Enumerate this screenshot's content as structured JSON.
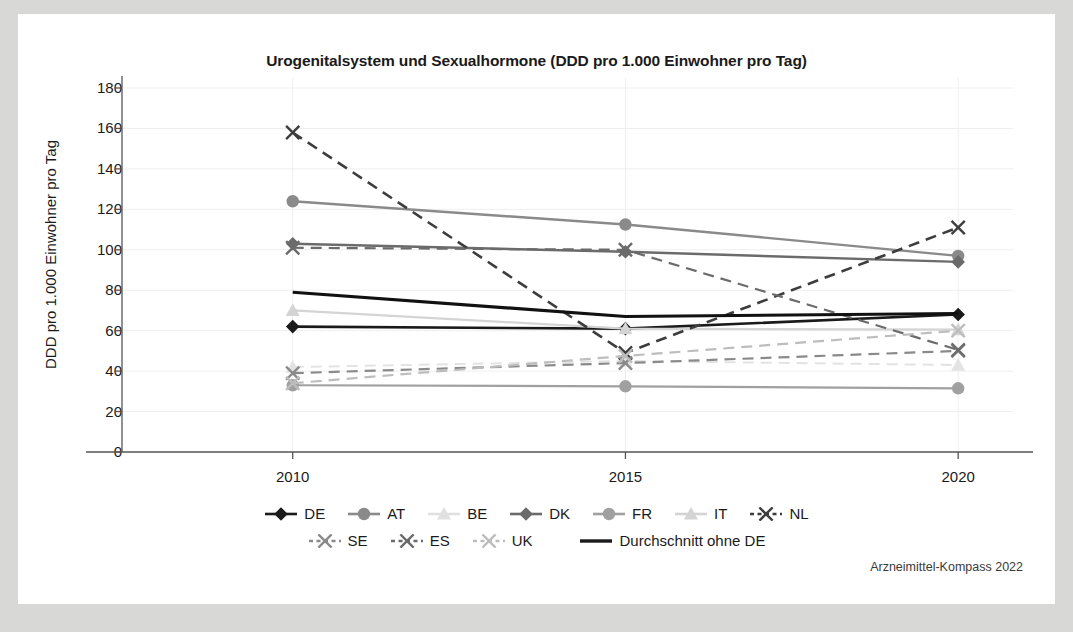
{
  "card": {
    "background": "#ffffff",
    "page_background": "#d8d8d6"
  },
  "source_note": "Arzneimittel-Kompass 2022",
  "axis": {
    "ylabel": "DDD pro 1.000 Einwohner pro Tag",
    "yticks": [
      180,
      160,
      140,
      120,
      100,
      80,
      60,
      40,
      20,
      0
    ],
    "xticks": [
      "2010",
      "2015",
      "2020"
    ]
  },
  "legend": {
    "rows": [
      [
        {
          "label": "DE",
          "marker": "diamond",
          "dash": "solid",
          "color": "#1a1a1a"
        },
        {
          "label": "AT",
          "marker": "circle",
          "dash": "solid",
          "color": "#8a8a8a"
        },
        {
          "label": "BE",
          "marker": "triangle",
          "dash": "solid",
          "color": "#e0e0e0"
        },
        {
          "label": "DK",
          "marker": "diamond",
          "dash": "solid",
          "color": "#6b6b6b"
        },
        {
          "label": "FR",
          "marker": "circle",
          "dash": "solid",
          "color": "#a0a0a0"
        },
        {
          "label": "IT",
          "marker": "triangle",
          "dash": "solid",
          "color": "#d4d4d4"
        },
        {
          "label": "NL",
          "marker": "cross",
          "dash": "dashed",
          "color": "#3d3d3d"
        }
      ],
      [
        {
          "label": "SE",
          "marker": "cross",
          "dash": "dashed",
          "color": "#8a8a8a"
        },
        {
          "label": "ES",
          "marker": "cross",
          "dash": "dashed",
          "color": "#6b6b6b"
        },
        {
          "label": "UK",
          "marker": "cross",
          "dash": "dashed",
          "color": "#bdbdbd"
        },
        {
          "label": "Durchschnitt ohne DE",
          "marker": "none",
          "dash": "solid",
          "color": "#1a1a1a"
        }
      ]
    ]
  },
  "chart_data": {
    "type": "line",
    "title": "Urogenitalsystem und Sexualhormone (DDD pro 1.000 Einwohner pro Tag)",
    "xlabel": "",
    "ylabel": "DDD pro 1.000 Einwohner pro Tag",
    "x": [
      "2010",
      "2015",
      "2020"
    ],
    "ylim": [
      0,
      180
    ],
    "ytick_step": 20,
    "grid": true,
    "legend_position": "bottom",
    "series": [
      {
        "name": "DE",
        "values": [
          62,
          61,
          68
        ],
        "marker": "diamond",
        "dash": "solid",
        "color": "#1a1a1a",
        "width": 2.6
      },
      {
        "name": "AT",
        "values": [
          124,
          112.5,
          97
        ],
        "marker": "circle",
        "dash": "solid",
        "color": "#8a8a8a",
        "width": 2.4
      },
      {
        "name": "BE",
        "values": [
          42,
          45,
          43
        ],
        "marker": "triangle",
        "dash": "dashed",
        "color": "#e3e3e3",
        "width": 2.0
      },
      {
        "name": "DK",
        "values": [
          103,
          99,
          94
        ],
        "marker": "diamond",
        "dash": "solid",
        "color": "#6b6b6b",
        "width": 2.4
      },
      {
        "name": "FR",
        "values": [
          33,
          32.5,
          31.5
        ],
        "marker": "circle",
        "dash": "solid",
        "color": "#a0a0a0",
        "width": 2.2
      },
      {
        "name": "IT",
        "values": [
          70,
          61,
          60.5
        ],
        "marker": "triangle",
        "dash": "solid",
        "color": "#d4d4d4",
        "width": 2.2
      },
      {
        "name": "NL",
        "values": [
          158,
          49,
          111
        ],
        "marker": "cross",
        "dash": "dashed",
        "color": "#3d3d3d",
        "width": 2.6
      },
      {
        "name": "SE",
        "values": [
          39,
          44,
          50
        ],
        "marker": "cross",
        "dash": "dashed",
        "color": "#8a8a8a",
        "width": 2.2
      },
      {
        "name": "ES",
        "values": [
          101,
          100,
          50.5
        ],
        "marker": "cross",
        "dash": "dashed",
        "color": "#6b6b6b",
        "width": 2.2
      },
      {
        "name": "UK",
        "values": [
          34,
          47.5,
          60
        ],
        "marker": "cross",
        "dash": "dashed",
        "color": "#bdbdbd",
        "width": 2.2
      },
      {
        "name": "Durchschnitt ohne DE",
        "values": [
          79,
          67,
          68.5
        ],
        "marker": "none",
        "dash": "solid",
        "color": "#111111",
        "width": 3.2
      }
    ]
  }
}
